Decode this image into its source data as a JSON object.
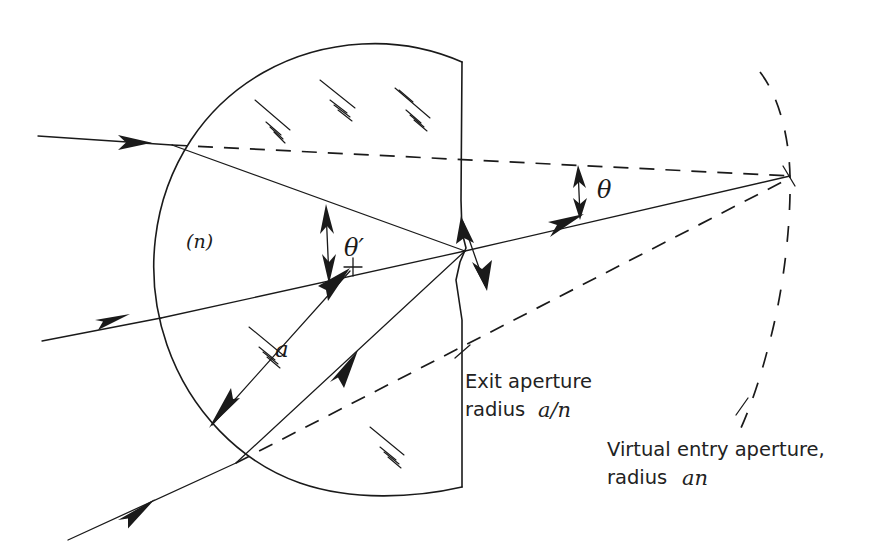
{
  "figure": {
    "background_color": "#ffffff",
    "ink_color": "#1a1a1a",
    "width": 887,
    "height": 555
  },
  "labels": {
    "medium_index": "(n)",
    "radius": "a",
    "angle_internal": "θ′",
    "angle_external": "θ",
    "exit_aperture_line1": "Exit aperture",
    "exit_aperture_line2_prefix": "radius ",
    "exit_aperture_line2_math": "a/n",
    "virtual_entry_line1": "Virtual entry aperture,",
    "virtual_entry_line2_prefix": "radius ",
    "virtual_entry_line2_math": "an"
  },
  "geometry": {
    "sphere_center": {
      "x": 355,
      "y": 257
    },
    "sphere_radius": 197,
    "flat_face_x": 462,
    "flat_face_top_y": 62,
    "flat_face_bottom_y": 487,
    "exit_point": {
      "x": 465,
      "y": 251
    },
    "convergence_point": {
      "x": 790,
      "y": 176
    },
    "virtual_arc_radius": 330,
    "center_mark": {
      "x": 352,
      "y": 267
    }
  },
  "rays": {
    "incoming": [
      {
        "name": "ray-top",
        "start": {
          "x": 38,
          "y": 136
        },
        "surface": {
          "x": 172,
          "y": 145
        }
      },
      {
        "name": "ray-middle",
        "start": {
          "x": 42,
          "y": 341
        },
        "surface": {
          "x": 161,
          "y": 318
        }
      },
      {
        "name": "ray-bottom",
        "start": {
          "x": 68,
          "y": 540
        },
        "surface": {
          "x": 235,
          "y": 462
        }
      }
    ],
    "exiting": {
      "name": "ray-exit",
      "from": {
        "x": 465,
        "y": 251
      },
      "to": {
        "x": 790,
        "y": 176
      }
    }
  },
  "elements": {
    "hatch_count": 6,
    "arrowhead_count": 4,
    "dashed_lines": 2,
    "dashed_arc": 1
  }
}
